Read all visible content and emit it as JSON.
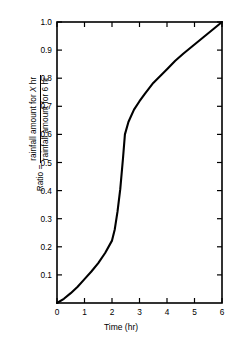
{
  "chart_data": {
    "type": "line",
    "title": "",
    "subtitle": "",
    "xlabel": "Time (hr)",
    "ylabel_lead": "Ratio = ",
    "ylabel_numerator": "rainfall amount for X hr",
    "ylabel_numerator_italic_token": "X",
    "ylabel_denominator": "rainfall amount for 6 hr",
    "ylabel_full": "Ratio = rainfall amount for X hr / rainfall amount for 6 hr",
    "xlim": [
      0,
      6
    ],
    "ylim": [
      0,
      1.0
    ],
    "xticks": [
      0,
      1,
      2,
      3,
      4,
      5,
      6
    ],
    "xtick_labels": [
      "0",
      "1",
      "2",
      "3",
      "4",
      "5",
      "6"
    ],
    "yticks": [
      0.1,
      0.2,
      0.3,
      0.4,
      0.5,
      0.6,
      0.7,
      0.8,
      0.9,
      1.0
    ],
    "ytick_labels": [
      "0.1",
      "0.2",
      "0.3",
      "0.4",
      "0.5",
      "0.6",
      "0.7",
      "0.8",
      "0.9",
      "1.0"
    ],
    "grid": false,
    "legend": null,
    "line_color": "#000000",
    "line_width": 2.1,
    "axis_color": "#000000",
    "background": "#ffffff",
    "series": [
      {
        "name": "rainfall ratio",
        "x": [
          0.0,
          0.25,
          0.5,
          0.75,
          1.0,
          1.25,
          1.5,
          1.75,
          2.0,
          2.1,
          2.2,
          2.3,
          2.4,
          2.47,
          2.6,
          2.8,
          3.0,
          3.2,
          3.5,
          3.8,
          4.0,
          4.3,
          4.6,
          5.0,
          5.4,
          5.7,
          6.0
        ],
        "y": [
          0.0,
          0.015,
          0.035,
          0.058,
          0.085,
          0.112,
          0.142,
          0.178,
          0.222,
          0.262,
          0.325,
          0.405,
          0.515,
          0.6,
          0.645,
          0.688,
          0.718,
          0.745,
          0.783,
          0.812,
          0.832,
          0.862,
          0.888,
          0.92,
          0.952,
          0.976,
          1.0
        ]
      }
    ],
    "annotations": [
      {
        "label": "sharp slope break",
        "x": 2.47,
        "y": 0.6
      },
      {
        "label": "slope change",
        "x": 2.0,
        "y": 0.222
      },
      {
        "label": "slope change",
        "x": 3.5,
        "y": 0.783
      }
    ]
  }
}
